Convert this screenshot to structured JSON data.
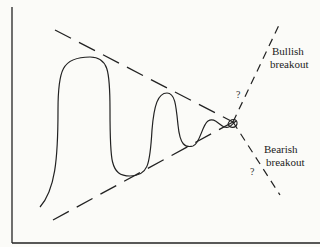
{
  "diagram": {
    "type": "symmetrical-triangle-pattern",
    "labels": {
      "bullish_line1": "Bullish",
      "bullish_line2": "breakout",
      "bearish_line1": "Bearish",
      "bearish_line2": "breakout",
      "question_upper": "?",
      "question_lower": "?"
    },
    "colors": {
      "ink": "#222222",
      "background": "#fbfbf8"
    }
  }
}
